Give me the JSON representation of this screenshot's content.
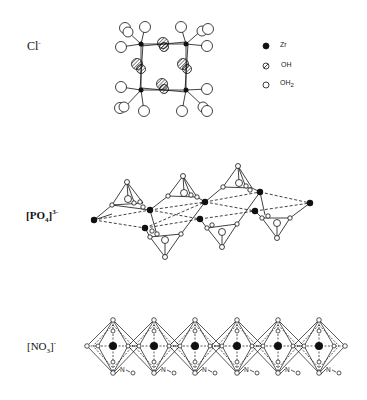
{
  "figure": {
    "panels": [
      {
        "id": "chloride",
        "anion_label": "Cl",
        "anion_charge": "-",
        "structure": "tetrameric Zr4(OH)8(H2O)16 cluster"
      },
      {
        "id": "phosphate",
        "anion_label": "[PO",
        "anion_sub": "4",
        "anion_close": "]",
        "anion_charge": "3-",
        "structure": "chain of Zr atoms bridged by PO4 tetrahedra"
      },
      {
        "id": "nitrate",
        "anion_label": "[NO",
        "anion_sub": "3",
        "anion_close": "]",
        "anion_charge": "-",
        "structure": "edge-sharing octahedra chain with N-O groups",
        "no_label": "N",
        "o_label": "O",
        "octahedra_count": 6
      }
    ],
    "legend": {
      "items": [
        {
          "symbol": "filled-circle",
          "label": "Zr"
        },
        {
          "symbol": "hatched-circle",
          "label": "OH"
        },
        {
          "symbol": "open-circle",
          "label": "OH",
          "sub": "2"
        }
      ]
    },
    "colors": {
      "ink": "#111111",
      "background": "#ffffff"
    }
  }
}
